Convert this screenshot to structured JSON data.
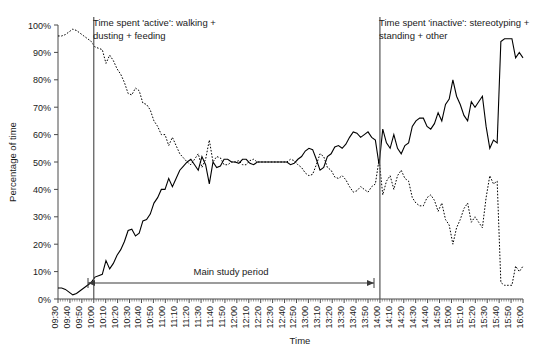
{
  "chart_data": {
    "type": "line",
    "title": "",
    "xlabel": "Time",
    "ylabel": "Percentage of time",
    "ylim": [
      0,
      100
    ],
    "ytick_labels": [
      "0%",
      "10%",
      "20%",
      "30%",
      "40%",
      "50%",
      "60%",
      "70%",
      "80%",
      "90%",
      "100%"
    ],
    "ytick_values": [
      0,
      10,
      20,
      30,
      40,
      50,
      60,
      70,
      80,
      90,
      100
    ],
    "grid": false,
    "legend_position": "none",
    "x_tick_labels": [
      "09:30",
      "09:40",
      "09:50",
      "10:00",
      "10:10",
      "10:20",
      "10:30",
      "10:40",
      "10:50",
      "11:00",
      "11:10",
      "11:20",
      "11:30",
      "11:40",
      "11:50",
      "12:00",
      "12:10",
      "12:20",
      "12:30",
      "12:40",
      "12:50",
      "13:00",
      "13:10",
      "13:20",
      "13:30",
      "13:40",
      "13:50",
      "14:00",
      "14:10",
      "14:20",
      "14:30",
      "14:40",
      "14:50",
      "15:00",
      "15:10",
      "15:20",
      "15:30",
      "15:40",
      "15:50",
      "16:00"
    ],
    "x_start": "09:30",
    "x_end": "16:00",
    "x_interval_minutes": 10,
    "series": [
      {
        "name": "Time spent 'inactive': stereotyping + standing + other",
        "style": "solid",
        "color": "#000000",
        "values": [
          4,
          4,
          3.5,
          2.5,
          1.5,
          2,
          3,
          4,
          5,
          6,
          8,
          8.5,
          9,
          14,
          11,
          13,
          16,
          18,
          21,
          25,
          25.5,
          23,
          24,
          28.5,
          29,
          31,
          35,
          37,
          40,
          40,
          44,
          41,
          44,
          47,
          48.5,
          50,
          51,
          49,
          47,
          52,
          49,
          42,
          50,
          48,
          48.5,
          51,
          51,
          50,
          50,
          49.5,
          51,
          51,
          49.5,
          49,
          50,
          50,
          50,
          50,
          50,
          50,
          50,
          50,
          50,
          49,
          49.5,
          51,
          52,
          54,
          55,
          54.5,
          51,
          47,
          48,
          52,
          53,
          55.5,
          56,
          55,
          56.5,
          59,
          61,
          60.5,
          59,
          60,
          61,
          59,
          58,
          49,
          62,
          57,
          55,
          60,
          55,
          53,
          56,
          57,
          63,
          65,
          66,
          66,
          63,
          62,
          64,
          68,
          65,
          71,
          73,
          80,
          74,
          71,
          67,
          65,
          72,
          70,
          72,
          74,
          63,
          55,
          58,
          57,
          94,
          95,
          95,
          95,
          88,
          90,
          88
        ]
      },
      {
        "name": "Time spent 'active': walking + dusting + feeding",
        "style": "dotted",
        "color": "#000000",
        "values": [
          96,
          96,
          96.5,
          97.5,
          98.5,
          98,
          97,
          96,
          95,
          94,
          92,
          91.5,
          91,
          86,
          89,
          87,
          84,
          82,
          79,
          75,
          74.5,
          77,
          76,
          71.5,
          71,
          69,
          65,
          63,
          60,
          60,
          56,
          59,
          56,
          53,
          51.5,
          50,
          49,
          51,
          53,
          48,
          51,
          58,
          50,
          52,
          51.5,
          49,
          49,
          50,
          50,
          50.5,
          49,
          49,
          50.5,
          51,
          50,
          50,
          50,
          50,
          50,
          50,
          50,
          50,
          50,
          51,
          50.5,
          49,
          48,
          46,
          45,
          45.5,
          49,
          53,
          52,
          48,
          47,
          44.5,
          44,
          45,
          43.5,
          41,
          39,
          39.5,
          41,
          40,
          39,
          41,
          42,
          51,
          38,
          43,
          45,
          40,
          45,
          47,
          44,
          43,
          37,
          35,
          34,
          34,
          37,
          38,
          36,
          32,
          35,
          29,
          27,
          20,
          26,
          29,
          33,
          35,
          28,
          30,
          28,
          26,
          37,
          45,
          42,
          43,
          6,
          5,
          5,
          5,
          12,
          10,
          12
        ]
      }
    ],
    "annotations": [
      {
        "name": "active-label",
        "text": "Time spent 'active': walking +\ndusting + feeding",
        "line_at": "10:00"
      },
      {
        "name": "inactive-label",
        "text": "Time spent 'inactive': stereotyping +\nstanding + other",
        "line_at": "14:00"
      },
      {
        "name": "main-study-period",
        "text": "Main study period",
        "from": "10:00",
        "to": "14:00"
      }
    ]
  },
  "labels": {
    "y_axis_title": "Percentage of time",
    "x_axis_title": "Time",
    "active_line1": "Time spent 'active': walking +",
    "active_line2": "dusting + feeding",
    "inactive_line1": "Time spent 'inactive': stereotyping +",
    "inactive_line2": "standing + other",
    "main_study_period": "Main study period"
  }
}
